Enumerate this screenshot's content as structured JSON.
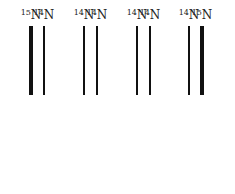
{
  "diagram": {
    "type": "DNA density gradient bands",
    "bands": [
      {
        "label_mass": "15",
        "label_elem": "N",
        "x": 31,
        "weight": "thick"
      },
      {
        "label_mass": "14",
        "label_elem": "N",
        "x": 44,
        "weight": "thin"
      },
      {
        "label_mass": "14",
        "label_elem": "N",
        "x": 84,
        "weight": "thin"
      },
      {
        "label_mass": "14",
        "label_elem": "N",
        "x": 97,
        "weight": "thin"
      },
      {
        "label_mass": "14",
        "label_elem": "N",
        "x": 137,
        "weight": "thin"
      },
      {
        "label_mass": "14",
        "label_elem": "N",
        "x": 150,
        "weight": "thin"
      },
      {
        "label_mass": "14",
        "label_elem": "N",
        "x": 189,
        "weight": "thin"
      },
      {
        "label_mass": "15",
        "label_elem": "N",
        "x": 202,
        "weight": "thick"
      }
    ]
  }
}
